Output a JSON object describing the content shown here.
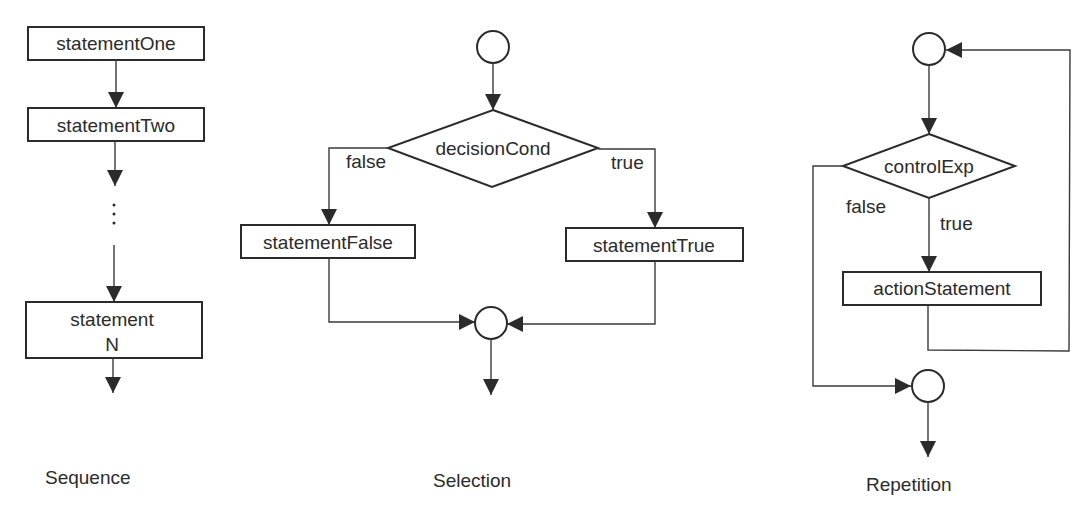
{
  "diagrams": {
    "sequence": {
      "caption": "Sequence",
      "nodes": {
        "statement_one": "statementOne",
        "statement_two": "statementTwo",
        "ellipsis": "⋮",
        "statement_n_line1": "statement",
        "statement_n_line2": "N"
      }
    },
    "selection": {
      "caption": "Selection",
      "nodes": {
        "decision": "decisionCond",
        "statement_false": "statementFalse",
        "statement_true": "statementTrue"
      },
      "edges": {
        "false_label": "false",
        "true_label": "true"
      }
    },
    "repetition": {
      "caption": "Repetition",
      "nodes": {
        "control": "controlExp",
        "action": "actionStatement"
      },
      "edges": {
        "false_label": "false",
        "true_label": "true"
      }
    }
  }
}
